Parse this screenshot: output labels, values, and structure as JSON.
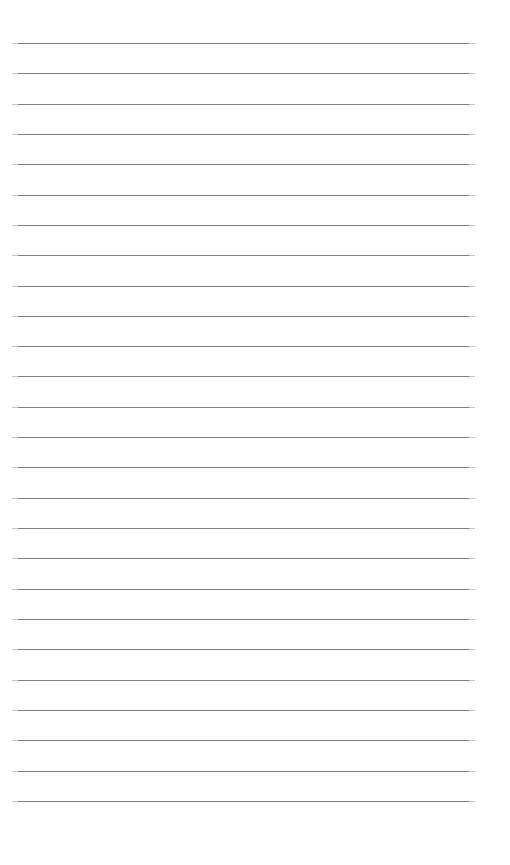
{
  "page": {
    "kind": "ruled-paper-sheet",
    "title": "",
    "background_color": "#ffffff",
    "width": 510,
    "height": 865,
    "header_text": "",
    "footer_text": "",
    "body_text": ""
  },
  "ruling": {
    "line_count": 26,
    "line_color": "#808080",
    "line_thickness": 1,
    "first_line_y": 43,
    "line_spacing": 30.3,
    "left_margin_x": 12,
    "right_edge_x": 475,
    "line_width": 463,
    "margin_rule_visible": false,
    "lines": [
      {
        "index": 1,
        "y": 43
      },
      {
        "index": 2,
        "y": 73
      },
      {
        "index": 3,
        "y": 104
      },
      {
        "index": 4,
        "y": 134
      },
      {
        "index": 5,
        "y": 164
      },
      {
        "index": 6,
        "y": 195
      },
      {
        "index": 7,
        "y": 225
      },
      {
        "index": 8,
        "y": 255
      },
      {
        "index": 9,
        "y": 286
      },
      {
        "index": 10,
        "y": 316
      },
      {
        "index": 11,
        "y": 346
      },
      {
        "index": 12,
        "y": 376
      },
      {
        "index": 13,
        "y": 407
      },
      {
        "index": 14,
        "y": 437
      },
      {
        "index": 15,
        "y": 467
      },
      {
        "index": 16,
        "y": 498
      },
      {
        "index": 17,
        "y": 528
      },
      {
        "index": 18,
        "y": 558
      },
      {
        "index": 19,
        "y": 589
      },
      {
        "index": 20,
        "y": 619
      },
      {
        "index": 21,
        "y": 649
      },
      {
        "index": 22,
        "y": 680
      },
      {
        "index": 23,
        "y": 710
      },
      {
        "index": 24,
        "y": 740
      },
      {
        "index": 25,
        "y": 771
      },
      {
        "index": 26,
        "y": 801
      }
    ]
  }
}
